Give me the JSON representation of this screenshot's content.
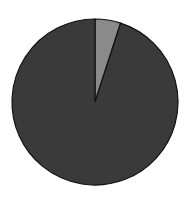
{
  "chart_data": {
    "type": "pie",
    "title": "",
    "labels": [
      "Small segment",
      "Large segment"
    ],
    "values": [
      5,
      95
    ],
    "colors": [
      "#8a8a8a",
      "#3a3a3a"
    ],
    "start_angle_deg": 0,
    "direction": "clockwise",
    "legend": "none",
    "center": [
      95,
      102
    ],
    "radius": 83
  }
}
